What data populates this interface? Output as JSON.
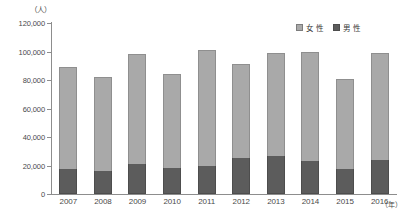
{
  "chart_data": {
    "type": "bar",
    "subtype": "stacked-vertical",
    "title": "",
    "xlabel": "(年)",
    "ylabel": "(人)",
    "yunit_label": "（人）",
    "xunit_label": "（年）",
    "categories": [
      "2007",
      "2008",
      "2009",
      "2010",
      "2011",
      "2012",
      "2013",
      "2014",
      "2015",
      "2016"
    ],
    "series": [
      {
        "name": "男性",
        "color": "#5c5c5c",
        "values": [
          17500,
          16500,
          21000,
          18500,
          20000,
          25000,
          27000,
          23500,
          17500,
          24000
        ]
      },
      {
        "name": "女性",
        "color": "#a9a9a9",
        "values": [
          71500,
          65500,
          77500,
          65500,
          81000,
          66000,
          72000,
          76500,
          63500,
          75000
        ]
      }
    ],
    "totals": [
      89000,
      82000,
      98500,
      84000,
      101000,
      91000,
      99000,
      100000,
      81000,
      99000
    ],
    "ylim": [
      0,
      120000
    ],
    "yticks": [
      0,
      20000,
      40000,
      60000,
      80000,
      100000,
      120000
    ],
    "ytick_labels": [
      "0",
      "20,000",
      "40,000",
      "60,000",
      "80,000",
      "100,000",
      "120,000"
    ],
    "grid": false,
    "legend_position": "top-right",
    "stack_order_bottom_to_top": [
      "男性",
      "女性"
    ]
  },
  "legend": {
    "items": [
      {
        "label": "女 性",
        "color": "#a9a9a9",
        "icon": "legend-swatch-female"
      },
      {
        "label": "男 性",
        "color": "#5c5c5c",
        "icon": "legend-swatch-male"
      }
    ]
  },
  "colors": {
    "female": "#a9a9a9",
    "male": "#5c5c5c",
    "axis": "#8d8d8d",
    "text": "#4a4a4a",
    "background": "#ffffff"
  }
}
